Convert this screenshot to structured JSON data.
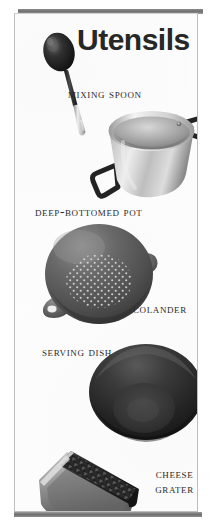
{
  "poster": {
    "title": "Utensils",
    "background_color": "#fdfdfd",
    "frame_color": "#6e6e6e",
    "text_color": "#2b2b2b"
  },
  "items": [
    {
      "label": "Mixing Spoon",
      "icon": "mixing-spoon-icon",
      "colors": {
        "bowl": "#1d1d1d",
        "handle_upper": "#2a2a2a",
        "handle_lower": "#c9c9c9"
      }
    },
    {
      "label": "Deep-Bottomed Pot",
      "icon": "deep-bottomed-pot-icon",
      "colors": {
        "body": "#b9b9b9",
        "rim": "#dedede",
        "handles": "#262626"
      }
    },
    {
      "label": "Colander",
      "icon": "colander-icon",
      "colors": {
        "body": "#5d5d5d",
        "holes": "#d8d8d8"
      }
    },
    {
      "label": "Serving Dish",
      "icon": "serving-dish-icon",
      "colors": {
        "body": "#2b2b2b",
        "inner": "#3a3a3a"
      }
    },
    {
      "label": "Cheese Grater",
      "icon": "cheese-grater-icon",
      "colors": {
        "frame": "#8a8a8a",
        "teeth": "#1f1f1f"
      }
    }
  ]
}
